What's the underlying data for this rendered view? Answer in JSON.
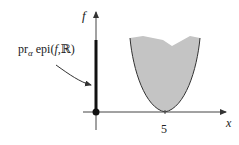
{
  "diagram": {
    "axes": {
      "y_label": "f",
      "x_label": "x",
      "x_tick_label": "5"
    },
    "annotation": {
      "prefix": "pr",
      "subscript": "α",
      "text": " epi(",
      "f": "f",
      "comma": ",",
      "set": "ℝ",
      "close": ")"
    },
    "colors": {
      "fill": "#c4c4c4",
      "stroke": "#333333",
      "axis": "#444444"
    }
  }
}
